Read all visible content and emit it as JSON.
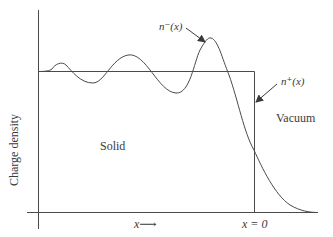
{
  "figure": {
    "y_axis_label": "Charge density",
    "region_solid": "Solid",
    "region_vacuum": "Vacuum",
    "curve_minus_label": "n⁻(x)",
    "curve_plus_label": "n⁺(x)",
    "x_direction_label": "x",
    "x_arrow_glyph": "⟶",
    "x_zero_label": "x = 0"
  },
  "colors": {
    "line": "#4a4a4a",
    "text": "#3a3a3a",
    "background": "#ffffff"
  }
}
